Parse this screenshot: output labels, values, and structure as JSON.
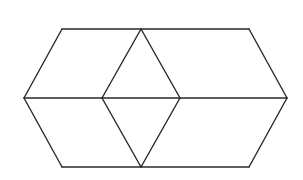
{
  "figure": {
    "stroke_color": "#2a2a2a",
    "background": "#ffffff",
    "vertices": {
      "A": [
        62,
        29
      ],
      "B": [
        141,
        29
      ],
      "C": [
        249,
        29
      ],
      "D": [
        24,
        98
      ],
      "E": [
        102,
        98
      ],
      "F": [
        180,
        98
      ],
      "G": [
        287,
        98
      ],
      "H": [
        62,
        167
      ],
      "I": [
        141,
        167
      ],
      "J": [
        249,
        167
      ]
    },
    "edges": [
      [
        "A",
        "C"
      ],
      [
        "C",
        "G"
      ],
      [
        "G",
        "J"
      ],
      [
        "J",
        "H"
      ],
      [
        "H",
        "D"
      ],
      [
        "D",
        "A"
      ],
      [
        "D",
        "G"
      ],
      [
        "B",
        "E"
      ],
      [
        "B",
        "F"
      ],
      [
        "E",
        "I"
      ],
      [
        "F",
        "I"
      ]
    ]
  }
}
